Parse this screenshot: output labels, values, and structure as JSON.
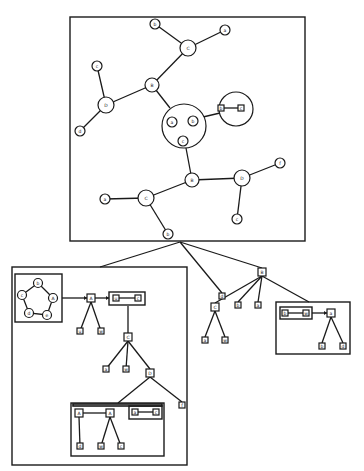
{
  "figure": {
    "colors": {
      "stroke": "#1a1a1a",
      "background": "#ffffff"
    }
  },
  "top_graph": {
    "nodes": [
      {
        "id": "t1",
        "label": "b",
        "x": 155,
        "y": 24,
        "r": 5
      },
      {
        "id": "t2",
        "label": "C",
        "x": 188,
        "y": 48,
        "r": 8
      },
      {
        "id": "t3",
        "label": "a",
        "x": 225,
        "y": 30,
        "r": 5
      },
      {
        "id": "t4",
        "label": "c",
        "x": 97,
        "y": 66,
        "r": 5
      },
      {
        "id": "t5",
        "label": "B",
        "x": 152,
        "y": 85,
        "r": 7
      },
      {
        "id": "t6",
        "label": "D",
        "x": 106,
        "y": 105,
        "r": 8
      },
      {
        "id": "t7",
        "label": "d",
        "x": 80,
        "y": 131,
        "r": 5
      },
      {
        "id": "t8a",
        "label": "a",
        "x": 172,
        "y": 122,
        "r": 5
      },
      {
        "id": "t8b",
        "label": "b",
        "x": 193,
        "y": 121,
        "r": 5
      },
      {
        "id": "t8c",
        "label": "c",
        "x": 183,
        "y": 141,
        "r": 5
      },
      {
        "id": "t10",
        "label": "B",
        "x": 192,
        "y": 180,
        "r": 7
      },
      {
        "id": "t11",
        "label": "D",
        "x": 242,
        "y": 178,
        "r": 8
      },
      {
        "id": "t12",
        "label": "f",
        "x": 280,
        "y": 163,
        "r": 5
      },
      {
        "id": "t13",
        "label": "c",
        "x": 237,
        "y": 219,
        "r": 5
      },
      {
        "id": "t14",
        "label": "C",
        "x": 146,
        "y": 198,
        "r": 8
      },
      {
        "id": "t15",
        "label": "a",
        "x": 105,
        "y": 199,
        "r": 5
      },
      {
        "id": "t16",
        "label": "b",
        "x": 168,
        "y": 234,
        "r": 5
      }
    ],
    "clusters": [
      {
        "id": "cl1",
        "x": 184,
        "y": 126,
        "r": 22
      },
      {
        "id": "cl2",
        "x": 236,
        "y": 109,
        "r": 17
      }
    ],
    "cluster_squares": [
      {
        "label": "b",
        "x": 221,
        "y": 108
      },
      {
        "label": "c",
        "x": 241,
        "y": 108
      }
    ]
  },
  "trees": {
    "left_box": {
      "cycle_nodes": [
        {
          "label": "b",
          "x": 38,
          "y": 283
        },
        {
          "label": "A",
          "x": 53,
          "y": 298
        },
        {
          "label": "e",
          "x": 47,
          "y": 315
        },
        {
          "label": "d",
          "x": 29,
          "y": 313
        },
        {
          "label": "c",
          "x": 22,
          "y": 295
        }
      ],
      "squares": [
        {
          "label": "A",
          "x": 91,
          "y": 298,
          "s": 8
        },
        {
          "label": "u",
          "x": 116,
          "y": 298,
          "s": 6
        },
        {
          "label": "c",
          "x": 138,
          "y": 298,
          "s": 6
        },
        {
          "label": "u",
          "x": 80,
          "y": 331,
          "s": 6
        },
        {
          "label": "w",
          "x": 101,
          "y": 331,
          "s": 6
        },
        {
          "label": "C",
          "x": 128,
          "y": 337,
          "s": 8
        },
        {
          "label": "a",
          "x": 106,
          "y": 369,
          "s": 6
        },
        {
          "label": "w",
          "x": 126,
          "y": 369,
          "s": 6
        },
        {
          "label": "D",
          "x": 150,
          "y": 373,
          "s": 8
        },
        {
          "label": "f",
          "x": 182,
          "y": 405,
          "s": 6
        },
        {
          "label": "A",
          "x": 79,
          "y": 413,
          "s": 8
        },
        {
          "label": "A",
          "x": 110,
          "y": 413,
          "s": 8
        },
        {
          "label": "a",
          "x": 135,
          "y": 412,
          "s": 6
        },
        {
          "label": "c",
          "x": 156,
          "y": 412,
          "s": 6
        },
        {
          "label": "d",
          "x": 80,
          "y": 446,
          "s": 6
        },
        {
          "label": "w",
          "x": 101,
          "y": 446,
          "s": 6
        },
        {
          "label": "c",
          "x": 121,
          "y": 446,
          "s": 6
        }
      ]
    },
    "middle": {
      "squares": [
        {
          "label": "d",
          "x": 222,
          "y": 296,
          "s": 6
        },
        {
          "label": "B",
          "x": 262,
          "y": 272,
          "s": 8
        },
        {
          "label": "C",
          "x": 215,
          "y": 307,
          "s": 8
        },
        {
          "label": "b",
          "x": 238,
          "y": 305,
          "s": 6
        },
        {
          "label": "a",
          "x": 258,
          "y": 305,
          "s": 6
        },
        {
          "label": "a",
          "x": 205,
          "y": 340,
          "s": 6
        },
        {
          "label": "w",
          "x": 225,
          "y": 340,
          "s": 6
        }
      ]
    },
    "right_box": {
      "squares": [
        {
          "label": "b",
          "x": 285,
          "y": 313,
          "s": 6
        },
        {
          "label": "w",
          "x": 306,
          "y": 313,
          "s": 6
        },
        {
          "label": "a",
          "x": 331,
          "y": 313,
          "s": 8
        },
        {
          "label": "b",
          "x": 322,
          "y": 346,
          "s": 6
        },
        {
          "label": "d",
          "x": 343,
          "y": 346,
          "s": 6
        }
      ]
    }
  }
}
